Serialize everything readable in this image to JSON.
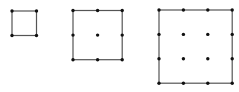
{
  "diagram": {
    "background": "#ffffff",
    "line_color": "#555555",
    "dot_color": "#111111",
    "grids": [
      {
        "name": "grid-1x1",
        "cells": 1,
        "x": 12,
        "y": 11,
        "cell_size": 24.5
      },
      {
        "name": "grid-2x2",
        "cells": 2,
        "x": 73,
        "y": 10.5,
        "cell_size": 24.6
      },
      {
        "name": "grid-3x3",
        "cells": 3,
        "x": 159,
        "y": 10,
        "cell_size": 24.4
      }
    ]
  }
}
